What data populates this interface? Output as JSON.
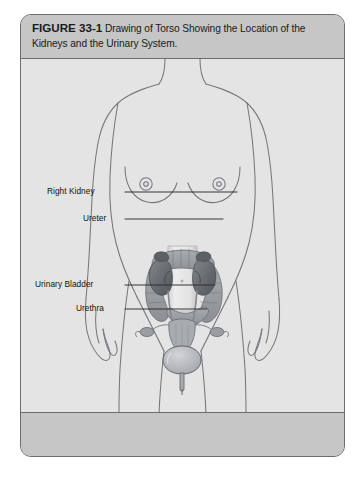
{
  "figure": {
    "number_label": "FIGURE 33-1",
    "caption": "Drawing of Torso Showing the Location of the Kidneys and the Urinary System.",
    "caption_line_1": "Drawing of Torso Showing the",
    "caption_line_2": "Location of the Kidneys and the Urinary System."
  },
  "colors": {
    "frame_border": "#6d6d6d",
    "band_background": "#c6c6c6",
    "illustration_background": "#e4e4e4",
    "body_outline": "#6f7277",
    "kidney_fill": "#6e7176",
    "intestine_fill": "#9a9da2",
    "spine_fill": "#dcdcdc",
    "bladder_fill": "#b4b7bc",
    "uterus_fill": "#a8abb0",
    "leader_line": "#2b2b2b",
    "label_text": "#111111"
  },
  "callouts": [
    {
      "id": "right-kidney",
      "label": "Right Kidney",
      "label_x": 46,
      "label_y": 214,
      "line_from_x": 124,
      "line_from_y": 221,
      "line_to_x": 236,
      "line_to_y": 221
    },
    {
      "id": "ureter",
      "label": "Ureter",
      "label_x": 82,
      "label_y": 241,
      "line_from_x": 124,
      "line_from_y": 248,
      "line_to_x": 222,
      "line_to_y": 248
    },
    {
      "id": "urinary-bladder",
      "label": "Urinary Bladder",
      "label_x": 34,
      "label_y": 307,
      "line_from_x": 124,
      "line_from_y": 314,
      "line_to_x": 214,
      "line_to_y": 314
    },
    {
      "id": "urethra",
      "label": "Urethra",
      "label_x": 75,
      "label_y": 331,
      "line_from_x": 124,
      "line_from_y": 338,
      "line_to_x": 206,
      "line_to_y": 338
    }
  ],
  "anatomy": {
    "subject": "female-torso",
    "organs": [
      "right-kidney",
      "left-kidney",
      "ureter",
      "urinary-bladder",
      "urethra",
      "large-intestine",
      "spinal-column",
      "uterus",
      "ovaries"
    ]
  }
}
